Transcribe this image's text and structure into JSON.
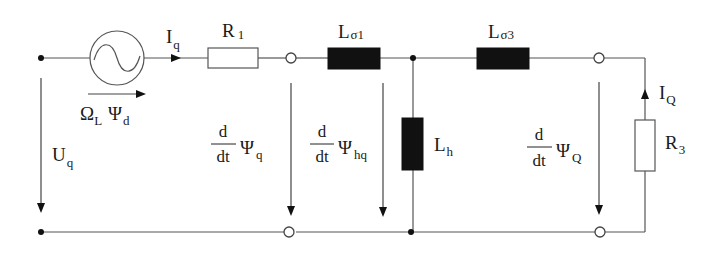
{
  "diagram": {
    "type": "equivalent-circuit",
    "colors": {
      "wire": "#555555",
      "inductor_fill": "#111111",
      "resistor_fill": "#ffffff",
      "background": "#ffffff"
    },
    "labels": {
      "current_q": {
        "main": "I",
        "sub": "q"
      },
      "r1": {
        "main": "R",
        "sub": "1"
      },
      "l_sigma1": {
        "main": "L",
        "sub": "σ1"
      },
      "l_sigma3": {
        "main": "L",
        "sub": "σ3"
      },
      "source_emf": {
        "main1": "Ω",
        "sub1": "L",
        "main2": "Ψ",
        "sub2": "d"
      },
      "voltage_q": {
        "main": "U",
        "sub": "q"
      },
      "dpsi_q": {
        "num": "d",
        "den": "dt",
        "main": "Ψ",
        "sub": "q"
      },
      "dpsi_hq": {
        "num": "d",
        "den": "dt",
        "main": "Ψ",
        "sub": "hq"
      },
      "l_h": {
        "main": "L",
        "sub": "h"
      },
      "dpsi_Q": {
        "num": "d",
        "den": "dt",
        "main": "Ψ",
        "sub": "Q"
      },
      "current_Q": {
        "main": "I",
        "sub": "Q"
      },
      "r3": {
        "main": "R",
        "sub": "3"
      }
    },
    "components": [
      {
        "id": "source",
        "kind": "ac-voltage-source"
      },
      {
        "id": "R1",
        "kind": "resistor"
      },
      {
        "id": "Lσ1",
        "kind": "inductor"
      },
      {
        "id": "Lh",
        "kind": "inductor"
      },
      {
        "id": "Lσ3",
        "kind": "inductor"
      },
      {
        "id": "R3",
        "kind": "resistor"
      }
    ]
  }
}
